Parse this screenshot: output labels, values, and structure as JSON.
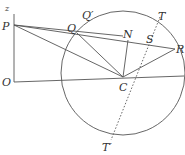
{
  "diagram": {
    "title": "",
    "colors": {
      "ink": "#555555",
      "label": "#333333",
      "background": "#ffffff"
    },
    "circle": {
      "center_label": "C",
      "cx": 123,
      "cy": 73,
      "r": 62
    },
    "points": [
      {
        "label": "z",
        "x": 6,
        "y": 12
      },
      {
        "label": "P",
        "x": 2,
        "y": 30
      },
      {
        "label": "O",
        "x": 2,
        "y": 86
      },
      {
        "label": "Q",
        "x": 66,
        "y": 33
      },
      {
        "label": "Q′",
        "x": 81,
        "y": 20
      },
      {
        "label": "N",
        "x": 123,
        "y": 38
      },
      {
        "label": "S",
        "x": 146,
        "y": 42
      },
      {
        "label": "T",
        "x": 158,
        "y": 21
      },
      {
        "label": "R",
        "x": 176,
        "y": 51
      },
      {
        "label": "C",
        "x": 119,
        "y": 90
      },
      {
        "label": "T′",
        "x": 102,
        "y": 151
      }
    ]
  }
}
